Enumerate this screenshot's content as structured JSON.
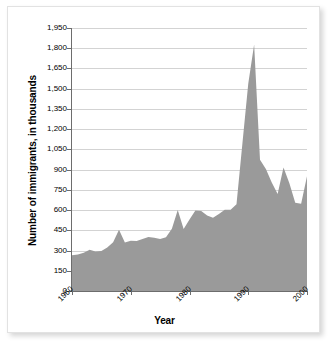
{
  "chart_data": {
    "type": "area",
    "title": "",
    "xlabel": "Year",
    "ylabel": "Number of immigrants, in thousands",
    "xlim": [
      1960,
      2000
    ],
    "ylim": [
      0,
      1950
    ],
    "grid": true,
    "legend": "none",
    "fill_color": "#9a9a9a",
    "x": [
      1960,
      1961,
      1962,
      1963,
      1964,
      1965,
      1966,
      1967,
      1968,
      1969,
      1970,
      1971,
      1972,
      1973,
      1974,
      1975,
      1976,
      1977,
      1978,
      1979,
      1980,
      1981,
      1982,
      1983,
      1984,
      1985,
      1986,
      1987,
      1988,
      1989,
      1990,
      1991,
      1992,
      1993,
      1994,
      1995,
      1996,
      1997,
      1998,
      1999,
      2000
    ],
    "values": [
      265,
      271,
      284,
      306,
      292,
      297,
      323,
      362,
      454,
      359,
      373,
      370,
      385,
      400,
      395,
      386,
      399,
      462,
      601,
      460,
      531,
      597,
      594,
      560,
      544,
      570,
      602,
      602,
      643,
      1091,
      1536,
      1827,
      974,
      904,
      804,
      720,
      916,
      798,
      654,
      647,
      850
    ],
    "y_ticks": [
      0,
      150,
      300,
      450,
      600,
      750,
      900,
      1050,
      1200,
      1350,
      1500,
      1650,
      1800,
      1950
    ],
    "y_tick_labels": [
      "0",
      "150",
      "300",
      "450",
      "600",
      "750",
      "900",
      "1,050",
      "1,200",
      "1,350",
      "1,500",
      "1,650",
      "1,800",
      "1,950"
    ],
    "x_ticks": [
      1960,
      1970,
      1980,
      1990,
      2000
    ],
    "x_tick_labels": [
      "1960",
      "1970",
      "1980",
      "1990",
      "2000"
    ]
  }
}
